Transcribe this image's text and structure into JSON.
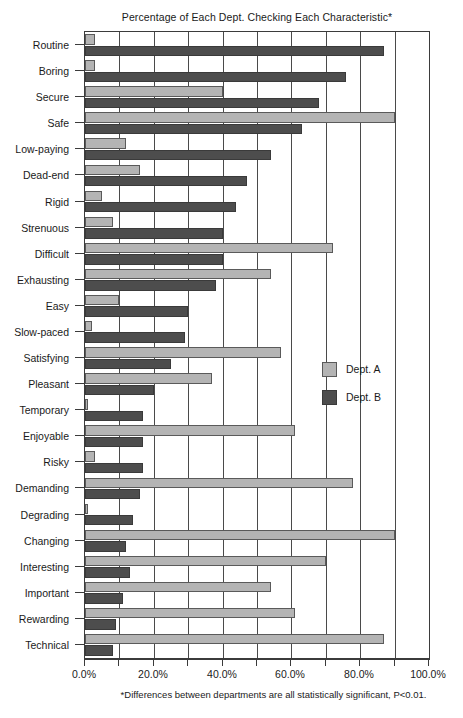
{
  "chart_data": {
    "type": "bar",
    "orientation": "horizontal",
    "title": "Percentage of Each Dept. Checking Each Characteristic*",
    "footnote": "*Differences between departments are all statistically significant, P<0.01.",
    "xlabel": "",
    "ylabel": "",
    "xlim": [
      0,
      100
    ],
    "xticks": [
      0,
      10,
      20,
      30,
      40,
      50,
      60,
      70,
      80,
      90,
      100
    ],
    "xtick_labels": [
      "0.0%",
      "",
      "20.0%",
      "",
      "40.0%",
      "",
      "60.0%",
      "",
      "80.0%",
      "",
      "100.0%"
    ],
    "xtick_labels_shown": [
      "0.0%",
      "20.0%",
      "40.0%",
      "60.0%",
      "80.0%",
      "100.0%"
    ],
    "grid": true,
    "legend_position": "middle-right",
    "categories": [
      "Routine",
      "Boring",
      "Secure",
      "Safe",
      "Low-paying",
      "Dead-end",
      "Rigid",
      "Strenuous",
      "Difficult",
      "Exhausting",
      "Easy",
      "Slow-paced",
      "Satisfying",
      "Pleasant",
      "Temporary",
      "Enjoyable",
      "Risky",
      "Demanding",
      "Degrading",
      "Changing",
      "Interesting",
      "Important",
      "Rewarding",
      "Technical"
    ],
    "series": [
      {
        "name": "Dept. A",
        "color": "#b4b4b4",
        "values": [
          3,
          3,
          40,
          90,
          12,
          16,
          5,
          8,
          72,
          54,
          10,
          2,
          57,
          37,
          1,
          61,
          3,
          78,
          1,
          90,
          70,
          54,
          61,
          87
        ]
      },
      {
        "name": "Dept. B",
        "color": "#4d4d4d",
        "values": [
          87,
          76,
          68,
          63,
          54,
          47,
          44,
          40,
          40,
          38,
          30,
          29,
          25,
          20,
          17,
          17,
          17,
          16,
          14,
          12,
          13,
          11,
          9,
          8
        ]
      }
    ]
  }
}
